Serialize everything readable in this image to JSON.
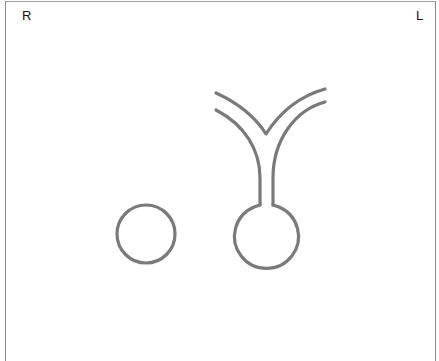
{
  "orientation": {
    "left_label": "R",
    "right_label": "L"
  },
  "diagram": {
    "stroke_color": "#7a7a7a",
    "background": "#ffffff",
    "shapes": [
      {
        "name": "round-structure",
        "type": "circle",
        "cx": 146,
        "cy": 234,
        "r": 29
      },
      {
        "name": "bulb-with-stem",
        "type": "bulb",
        "cx": 266,
        "cy": 237,
        "r": 32
      },
      {
        "name": "y-branches",
        "type": "branching-tubes"
      }
    ]
  }
}
